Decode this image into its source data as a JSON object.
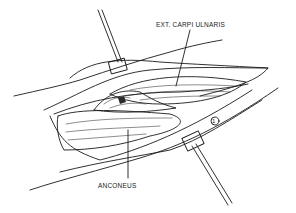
{
  "figure": {
    "type": "surgical-illustration",
    "labels": {
      "top": "EXT. CARPI ULNARIS",
      "bottom": "ANCONEUS",
      "marker": "1"
    },
    "colors": {
      "line": "#1a1a1a",
      "background": "#ffffff",
      "shade": "#2a2a2a"
    }
  }
}
